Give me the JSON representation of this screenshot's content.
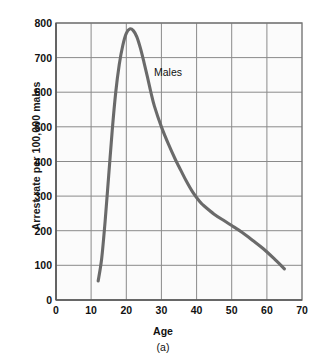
{
  "chart_data": {
    "type": "line",
    "title": "",
    "caption": "(a)",
    "xlabel": "Age",
    "ylabel": "Arrest rate per 100,000 males",
    "xlim": [
      0,
      70
    ],
    "ylim": [
      0,
      800
    ],
    "xticks": [
      0,
      10,
      20,
      30,
      40,
      50,
      60,
      70
    ],
    "yticks": [
      0,
      100,
      200,
      300,
      400,
      500,
      600,
      700,
      800
    ],
    "grid": true,
    "legend_position": "inline-annotation",
    "series": [
      {
        "name": "Males",
        "color": "#6a6a6a",
        "x": [
          12,
          13,
          14,
          15,
          16,
          17,
          18,
          19,
          20,
          21,
          22,
          23,
          24,
          25,
          26,
          27,
          28,
          30,
          32,
          34,
          35,
          37,
          39,
          41,
          42,
          45,
          48,
          50,
          53,
          56,
          59,
          62,
          65
        ],
        "values": [
          55,
          120,
          230,
          360,
          490,
          600,
          680,
          735,
          770,
          783,
          778,
          760,
          728,
          688,
          645,
          600,
          560,
          500,
          450,
          405,
          385,
          345,
          310,
          283,
          273,
          248,
          228,
          215,
          195,
          172,
          148,
          120,
          90
        ]
      }
    ],
    "annotations": [
      {
        "text": "Males",
        "x": 30,
        "y": 650
      }
    ]
  },
  "axis": {
    "x_tick_labels": [
      "0",
      "10",
      "20",
      "30",
      "40",
      "50",
      "60",
      "70"
    ],
    "y_tick_labels": [
      "0",
      "100",
      "200",
      "300",
      "400",
      "500",
      "600",
      "700",
      "800"
    ],
    "x_title": "Age",
    "y_title": "Arrest rate per 100,000 males",
    "figure_caption": "(a)"
  },
  "colors": {
    "curve": "#6a6a6a",
    "gridline": "#8a8a8a",
    "axis": "#555555",
    "plot_background": "#fbfbfb",
    "text": "#111111"
  }
}
